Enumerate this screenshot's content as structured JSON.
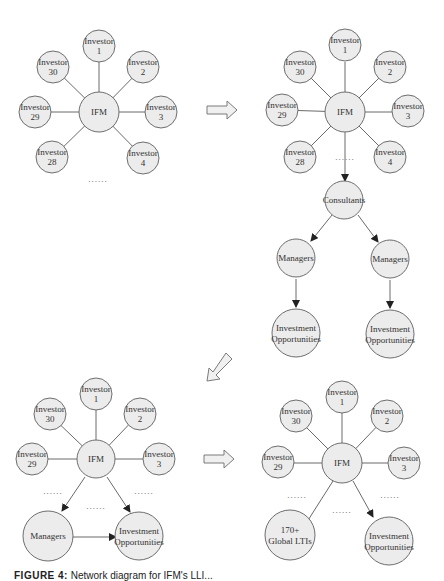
{
  "diagram": {
    "panels": [
      {
        "id": "panel-1",
        "hub": "IFM",
        "investors": [
          "Investor 1",
          "Investor 2",
          "Investor 3",
          "Investor 4",
          "Investor 28",
          "Investor 29",
          "Investor 30"
        ],
        "ellipsis": "......"
      },
      {
        "id": "panel-2",
        "hub": "IFM",
        "investors": [
          "Investor 1",
          "Investor 2",
          "Investor 3",
          "Investor 4",
          "Investor 28",
          "Investor 29",
          "Investor 30"
        ],
        "ellipsis": "......",
        "chain": [
          "Consultants",
          "Managers",
          "Managers",
          "Investment Opportunities",
          "Investment Opportunities"
        ]
      },
      {
        "id": "panel-3",
        "hub": "IFM",
        "investors": [
          "Investor 1",
          "Investor 2",
          "Investor 3",
          "Investor 29",
          "Investor 30"
        ],
        "ellipsis": "......",
        "nodes": [
          "Managers",
          "Investment Opportunities"
        ]
      },
      {
        "id": "panel-4",
        "hub": "IFM",
        "investors": [
          "Investor 1",
          "Investor 2",
          "Investor 3",
          "Investor 29",
          "Investor 30"
        ],
        "ellipsis": "......",
        "nodes": [
          "170+ Global LTIs",
          "Investment Opportunities"
        ]
      }
    ],
    "labels": {
      "investor": "Investor",
      "n1": "1",
      "n2": "2",
      "n3": "3",
      "n4": "4",
      "n28": "28",
      "n29": "29",
      "n30": "30",
      "ifm": "IFM",
      "consultants": "Consultants",
      "managers": "Managers",
      "investment": "Investment",
      "opportunities": "Opportunities",
      "ltis_1": "170+",
      "ltis_2": "Global LTIs",
      "dots": "......"
    },
    "transition_arrows": [
      "right",
      "down-left",
      "right"
    ]
  },
  "caption": {
    "label": "FIGURE 4:",
    "text": "Network diagram for IFM's LLI..."
  }
}
